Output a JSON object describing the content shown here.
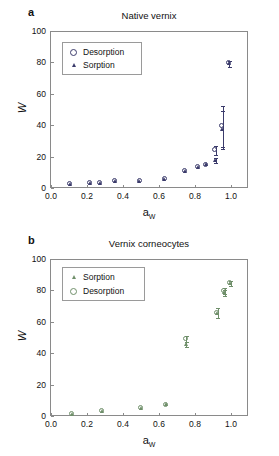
{
  "figure": {
    "panels": [
      {
        "letter": "a",
        "title": "Native vernix",
        "axis": {
          "ylabel": "W",
          "xlabel_base": "a",
          "xlabel_sub": "W",
          "yticks": [
            "0",
            "20",
            "40",
            "60",
            "80",
            "100"
          ],
          "xticks": [
            "0.0",
            "0.2",
            "0.4",
            "0.6",
            "0.8",
            "1.0"
          ],
          "ylim": [
            0,
            100
          ],
          "xlim": [
            0.0,
            1.1
          ]
        },
        "legend": [
          {
            "label": "Desorption",
            "marker": "circle-open-marker"
          },
          {
            "label": "Sorption",
            "marker": "triangle-filled-marker"
          }
        ],
        "color": "#3b3b6b"
      },
      {
        "letter": "b",
        "title": "Vernix corneocytes",
        "axis": {
          "ylabel": "W",
          "xlabel_base": "a",
          "xlabel_sub": "W",
          "yticks": [
            "0",
            "20",
            "40",
            "60",
            "80",
            "100"
          ],
          "xticks": [
            "0.0",
            "0.2",
            "0.4",
            "0.6",
            "0.8",
            "1.0"
          ],
          "ylim": [
            0,
            100
          ],
          "xlim": [
            0.0,
            1.1
          ]
        },
        "legend": [
          {
            "label": "Sorption",
            "marker": "triangle-filled-marker"
          },
          {
            "label": "Desorption",
            "marker": "circle-open-marker"
          }
        ],
        "color": "#6f8f6a"
      }
    ]
  },
  "chart_data": [
    {
      "type": "scatter",
      "title": "Native vernix",
      "panel": "a",
      "xlabel": "aW",
      "ylabel": "W",
      "xlim": [
        0.0,
        1.1
      ],
      "ylim": [
        0,
        100
      ],
      "xticks": [
        0.0,
        0.2,
        0.4,
        0.6,
        0.8,
        1.0
      ],
      "yticks": [
        0,
        20,
        40,
        60,
        80,
        100
      ],
      "grid": false,
      "legend_position": "upper-left-inside",
      "series": [
        {
          "name": "Sorption",
          "marker": "triangle-filled",
          "color": "#3b3b6b",
          "x": [
            0.11,
            0.22,
            0.28,
            0.36,
            0.5,
            0.64,
            0.755,
            0.83,
            0.875,
            0.925,
            0.965,
            1.0
          ],
          "y": [
            2.0,
            2.7,
            3.0,
            4.3,
            4.2,
            5.3,
            10.6,
            13.2,
            14.6,
            17.5,
            37.0,
            79.0
          ],
          "yerr": [
            0.4,
            0.4,
            0.4,
            0.4,
            0.4,
            0.5,
            0.6,
            0.7,
            0.8,
            1.8,
            12.0,
            2.0
          ]
        },
        {
          "name": "Desorption",
          "marker": "circle-open",
          "color": "#3b3b6b",
          "x": [
            0.11,
            0.22,
            0.28,
            0.36,
            0.5,
            0.64,
            0.755,
            0.83,
            0.875,
            0.925,
            0.965,
            1.0
          ],
          "y": [
            2.0,
            2.7,
            3.0,
            4.3,
            4.2,
            5.3,
            10.6,
            13.2,
            14.6,
            24.0,
            39.0,
            79.0
          ],
          "yerr": [
            0.4,
            0.4,
            0.4,
            0.4,
            0.4,
            0.5,
            0.6,
            0.7,
            0.8,
            3.0,
            13.0,
            2.0
          ]
        }
      ]
    },
    {
      "type": "scatter",
      "title": "Vernix corneocytes",
      "panel": "b",
      "xlabel": "aW",
      "ylabel": "W",
      "xlim": [
        0.0,
        1.1
      ],
      "ylim": [
        0,
        100
      ],
      "xticks": [
        0.0,
        0.2,
        0.4,
        0.6,
        0.8,
        1.0
      ],
      "yticks": [
        0,
        20,
        40,
        60,
        80,
        100
      ],
      "grid": false,
      "legend_position": "upper-left-inside",
      "series": [
        {
          "name": "Sorption",
          "marker": "triangle-filled",
          "color": "#6f8f6a",
          "x": [
            0.12,
            0.29,
            0.51,
            0.65,
            0.76,
            0.935,
            0.975,
            1.01
          ],
          "y": [
            1.2,
            3.0,
            4.8,
            7.0,
            45.5,
            65.5,
            78.5,
            84.5
          ],
          "yerr": [
            0.5,
            0.5,
            0.5,
            0.6,
            1.5,
            3.0,
            2.0,
            1.5
          ]
        },
        {
          "name": "Desorption",
          "marker": "circle-open",
          "color": "#6f8f6a",
          "x": [
            0.12,
            0.29,
            0.51,
            0.65,
            0.76,
            0.935,
            0.975,
            1.01
          ],
          "y": [
            1.2,
            3.0,
            4.8,
            7.0,
            49.0,
            65.5,
            79.5,
            84.5
          ],
          "yerr": [
            0.5,
            0.5,
            0.5,
            0.6,
            2.0,
            3.0,
            2.0,
            1.5
          ]
        }
      ]
    }
  ]
}
